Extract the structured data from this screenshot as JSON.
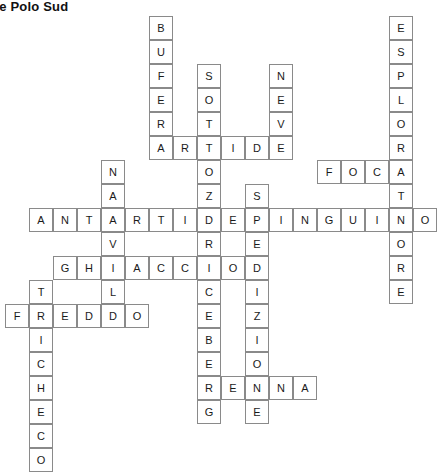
{
  "title": "rd e Polo Sud",
  "grid": {
    "cell_size": 24,
    "origin_x": 5,
    "origin_y": 16,
    "col_x": [
      5,
      29,
      53,
      77,
      101,
      125,
      149,
      173,
      197,
      221,
      245,
      269,
      293,
      317,
      341,
      365,
      389
    ],
    "row_y": [
      16,
      40,
      64,
      88,
      112,
      136,
      160,
      184,
      208,
      232,
      256,
      280,
      304,
      328,
      352,
      376,
      400,
      424
    ]
  },
  "entries": [
    {
      "answer": "BUFERA",
      "direction": "down",
      "col": 6,
      "row": 0,
      "letters": [
        "B",
        "U",
        "F",
        "E",
        "R",
        "A"
      ]
    },
    {
      "answer": "ESPLORATORE",
      "direction": "down",
      "col": 16,
      "row": 0,
      "letters": [
        "E",
        "S",
        "P",
        "L",
        "O",
        "R",
        "A",
        "T",
        "O",
        "R",
        "E"
      ]
    },
    {
      "answer": "SOTTOZERO",
      "direction": "down",
      "col": 8,
      "row": 2,
      "letters": [
        "S",
        "O",
        "T",
        "T",
        "O",
        "Z",
        "E",
        "R",
        "O"
      ]
    },
    {
      "answer": "NEVE",
      "direction": "down",
      "col": 11,
      "row": 2,
      "letters": [
        "N",
        "E",
        "V",
        "E"
      ]
    },
    {
      "answer": "ARTIDE",
      "direction": "across",
      "col": 6,
      "row": 5,
      "letters": [
        "A",
        "R",
        "T",
        "I",
        "D",
        "E"
      ]
    },
    {
      "answer": "NARVALO",
      "direction": "down",
      "col": 4,
      "row": 6,
      "letters": [
        "N",
        "A",
        "R",
        "V",
        "A",
        "L",
        "O"
      ]
    },
    {
      "answer": "FOCA",
      "direction": "across",
      "col": 13,
      "row": 6,
      "letters": [
        "F",
        "O",
        "C",
        "A"
      ]
    },
    {
      "answer": "SPEDIZIONE",
      "direction": "down",
      "col": 10,
      "row": 7,
      "letters": [
        "S",
        "P",
        "E",
        "D",
        "I",
        "Z",
        "I",
        "O",
        "N",
        "E"
      ]
    },
    {
      "answer": "ANTARTIDE",
      "direction": "across",
      "col": 1,
      "row": 8,
      "letters": [
        "A",
        "N",
        "T",
        "A",
        "R",
        "T",
        "I",
        "D",
        "E"
      ]
    },
    {
      "answer": "PINGUINO",
      "direction": "across",
      "col": 10,
      "row": 8,
      "letters": [
        "P",
        "I",
        "N",
        "G",
        "U",
        "I",
        "N",
        "O"
      ]
    },
    {
      "answer": "GHIACCIO",
      "direction": "across",
      "col": 2,
      "row": 9,
      "letters": [
        "G",
        "H",
        "I",
        "A",
        "C",
        "C",
        "I",
        "O"
      ]
    },
    {
      "answer": "TRICHECO",
      "direction": "down",
      "col": 1,
      "row": 10,
      "letters": [
        "T",
        "R",
        "I",
        "C",
        "H",
        "E",
        "C",
        "O"
      ]
    },
    {
      "answer": "ICEBERG",
      "direction": "down",
      "col": 9,
      "row": 10,
      "letters": [
        "I",
        "C",
        "E",
        "B",
        "E",
        "R",
        "G"
      ]
    },
    {
      "answer": "FREDDO",
      "direction": "across",
      "col": 0,
      "row": 11,
      "letters": [
        "F",
        "R",
        "E",
        "D",
        "D",
        "O"
      ]
    },
    {
      "answer": "RENNA",
      "direction": "across",
      "col": 7,
      "row": 14,
      "letters": [
        "R",
        "E",
        "N",
        "N",
        "A"
      ]
    }
  ],
  "cells": [
    {
      "col": 6,
      "row": 0,
      "letter": "B"
    },
    {
      "col": 16,
      "row": 0,
      "letter": "E"
    },
    {
      "col": 6,
      "row": 1,
      "letter": "U"
    },
    {
      "col": 16,
      "row": 1,
      "letter": "S"
    },
    {
      "col": 6,
      "row": 2,
      "letter": "F"
    },
    {
      "col": 8,
      "row": 2,
      "letter": "S"
    },
    {
      "col": 11,
      "row": 2,
      "letter": "N"
    },
    {
      "col": 16,
      "row": 2,
      "letter": "P"
    },
    {
      "col": 6,
      "row": 3,
      "letter": "E"
    },
    {
      "col": 8,
      "row": 3,
      "letter": "O"
    },
    {
      "col": 11,
      "row": 3,
      "letter": "E"
    },
    {
      "col": 16,
      "row": 3,
      "letter": "L"
    },
    {
      "col": 6,
      "row": 4,
      "letter": "R"
    },
    {
      "col": 8,
      "row": 4,
      "letter": "T"
    },
    {
      "col": 11,
      "row": 4,
      "letter": "V"
    },
    {
      "col": 16,
      "row": 4,
      "letter": "O"
    },
    {
      "col": 6,
      "row": 5,
      "letter": "A"
    },
    {
      "col": 7,
      "row": 5,
      "letter": "R"
    },
    {
      "col": 8,
      "row": 5,
      "letter": "T"
    },
    {
      "col": 9,
      "row": 5,
      "letter": "I"
    },
    {
      "col": 10,
      "row": 5,
      "letter": "D"
    },
    {
      "col": 11,
      "row": 5,
      "letter": "E"
    },
    {
      "col": 16,
      "row": 5,
      "letter": "R"
    },
    {
      "col": 4,
      "row": 6,
      "letter": "N"
    },
    {
      "col": 8,
      "row": 6,
      "letter": "O"
    },
    {
      "col": 13,
      "row": 6,
      "letter": "F"
    },
    {
      "col": 14,
      "row": 6,
      "letter": "O"
    },
    {
      "col": 15,
      "row": 6,
      "letter": "C"
    },
    {
      "col": 16,
      "row": 6,
      "letter": "A"
    },
    {
      "col": 4,
      "row": 7,
      "letter": "A"
    },
    {
      "col": 8,
      "row": 7,
      "letter": "Z"
    },
    {
      "col": 10,
      "row": 7,
      "letter": "S"
    },
    {
      "col": 16,
      "row": 7,
      "letter": "T"
    },
    {
      "col": 1,
      "row": 8,
      "letter": "A"
    },
    {
      "col": 2,
      "row": 8,
      "letter": "N"
    },
    {
      "col": 3,
      "row": 8,
      "letter": "T"
    },
    {
      "col": 4,
      "row": 8,
      "letter": "A"
    },
    {
      "col": 5,
      "row": 8,
      "letter": "R"
    },
    {
      "col": 6,
      "row": 8,
      "letter": "T"
    },
    {
      "col": 7,
      "row": 8,
      "letter": "I"
    },
    {
      "col": 8,
      "row": 8,
      "letter": "D"
    },
    {
      "col": 9,
      "row": 8,
      "letter": "E"
    },
    {
      "col": 10,
      "row": 8,
      "letter": "P"
    },
    {
      "col": 11,
      "row": 8,
      "letter": "I"
    },
    {
      "col": 12,
      "row": 8,
      "letter": "N"
    },
    {
      "col": 13,
      "row": 8,
      "letter": "G"
    },
    {
      "col": 14,
      "row": 8,
      "letter": "U"
    },
    {
      "col": 15,
      "row": 8,
      "letter": "I"
    },
    {
      "col": 16,
      "row": 8,
      "letter": "N"
    },
    {
      "col": 17,
      "row": 8,
      "letter": "O"
    },
    {
      "col": 4,
      "row": 9,
      "letter": "V"
    },
    {
      "col": 8,
      "row": 9,
      "letter": "R"
    },
    {
      "col": 10,
      "row": 9,
      "letter": "E"
    },
    {
      "col": 16,
      "row": 9,
      "letter": "O"
    },
    {
      "col": 2,
      "row": 10,
      "letter": "G"
    },
    {
      "col": 3,
      "row": 10,
      "letter": "H"
    },
    {
      "col": 4,
      "row": 10,
      "letter": "I"
    },
    {
      "col": 5,
      "row": 10,
      "letter": "A"
    },
    {
      "col": 6,
      "row": 10,
      "letter": "C"
    },
    {
      "col": 7,
      "row": 10,
      "letter": "C"
    },
    {
      "col": 8,
      "row": 10,
      "letter": "I"
    },
    {
      "col": 9,
      "row": 10,
      "letter": "O"
    },
    {
      "col": 10,
      "row": 10,
      "letter": "D"
    },
    {
      "col": 16,
      "row": 10,
      "letter": "R"
    },
    {
      "col": 1,
      "row": 11,
      "letter": "T"
    },
    {
      "col": 4,
      "row": 11,
      "letter": "L"
    },
    {
      "col": 8,
      "row": 11,
      "letter": "C"
    },
    {
      "col": 10,
      "row": 11,
      "letter": "I"
    },
    {
      "col": 16,
      "row": 11,
      "letter": "E"
    },
    {
      "col": 0,
      "row": 12,
      "letter": "F"
    },
    {
      "col": 1,
      "row": 12,
      "letter": "R"
    },
    {
      "col": 2,
      "row": 12,
      "letter": "E"
    },
    {
      "col": 3,
      "row": 12,
      "letter": "D"
    },
    {
      "col": 4,
      "row": 12,
      "letter": "D"
    },
    {
      "col": 5,
      "row": 12,
      "letter": "O"
    },
    {
      "col": 8,
      "row": 12,
      "letter": "E"
    },
    {
      "col": 10,
      "row": 12,
      "letter": "Z"
    },
    {
      "col": 1,
      "row": 13,
      "letter": "I"
    },
    {
      "col": 8,
      "row": 13,
      "letter": "B"
    },
    {
      "col": 10,
      "row": 13,
      "letter": "I"
    },
    {
      "col": 1,
      "row": 14,
      "letter": "C"
    },
    {
      "col": 8,
      "row": 14,
      "letter": "E"
    },
    {
      "col": 10,
      "row": 14,
      "letter": "O"
    },
    {
      "col": 1,
      "row": 15,
      "letter": "H"
    },
    {
      "col": 8,
      "row": 15,
      "letter": "R"
    },
    {
      "col": 9,
      "row": 15,
      "letter": "E"
    },
    {
      "col": 10,
      "row": 15,
      "letter": "N"
    },
    {
      "col": 11,
      "row": 15,
      "letter": "N"
    },
    {
      "col": 12,
      "row": 15,
      "letter": "A"
    },
    {
      "col": 1,
      "row": 16,
      "letter": "E"
    },
    {
      "col": 8,
      "row": 16,
      "letter": "G"
    },
    {
      "col": 10,
      "row": 16,
      "letter": "E"
    },
    {
      "col": 1,
      "row": 17,
      "letter": "C"
    },
    {
      "col": 1,
      "row": 18,
      "letter": "O"
    }
  ],
  "colors": {
    "cell_border": "#8a8a8a",
    "cell_fill": "#ffffff",
    "letter": "#1a1a1a",
    "title": "#111111",
    "page_background": "#ffffff"
  }
}
